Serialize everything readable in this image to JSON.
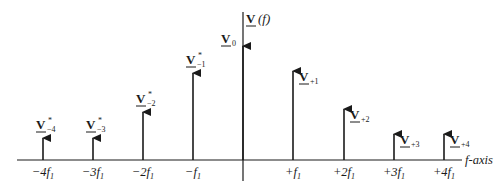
{
  "diagram": {
    "axis_label": "f-axis",
    "line_color": "#1a1a1a",
    "spectral_lines": [
      {
        "id": "m4",
        "label_main": "V",
        "label_sup": "*",
        "label_sub": "−4",
        "tick_main": "−4f",
        "tick_sub": "1",
        "x": 43,
        "top": 137
      },
      {
        "id": "m3",
        "label_main": "V",
        "label_sup": "*",
        "label_sub": "−3",
        "tick_main": "−3f",
        "tick_sub": "1",
        "x": 93,
        "top": 137
      },
      {
        "id": "m2",
        "label_main": "V",
        "label_sup": "*",
        "label_sub": "−2",
        "tick_main": "−2f",
        "tick_sub": "1",
        "x": 143,
        "top": 111
      },
      {
        "id": "m1",
        "label_main": "V",
        "label_sup": "*",
        "label_sub": "−1",
        "tick_main": "−f",
        "tick_sub": "1",
        "x": 193,
        "top": 72
      },
      {
        "id": "z0",
        "label_main": "V",
        "label_sup": "",
        "label_sub": "0",
        "tick_main": "",
        "tick_sub": "",
        "x": 243,
        "top": 45
      },
      {
        "id": "p1",
        "label_main": "V",
        "label_sup": "",
        "label_sub": "+1",
        "tick_main": "+f",
        "tick_sub": "1",
        "x": 293,
        "top": 70
      },
      {
        "id": "p2",
        "label_main": "V",
        "label_sup": "",
        "label_sub": "+2",
        "tick_main": "+2f",
        "tick_sub": "1",
        "x": 344,
        "top": 108
      },
      {
        "id": "p3",
        "label_main": "V",
        "label_sup": "",
        "label_sub": "+3",
        "tick_main": "+3f",
        "tick_sub": "1",
        "x": 394,
        "top": 133
      },
      {
        "id": "p4",
        "label_main": "V",
        "label_sup": "",
        "label_sub": "+4",
        "tick_main": "+4f",
        "tick_sub": "1",
        "x": 444,
        "top": 133
      }
    ],
    "title_parts": {
      "main": "V",
      "rest": "(f)"
    }
  }
}
